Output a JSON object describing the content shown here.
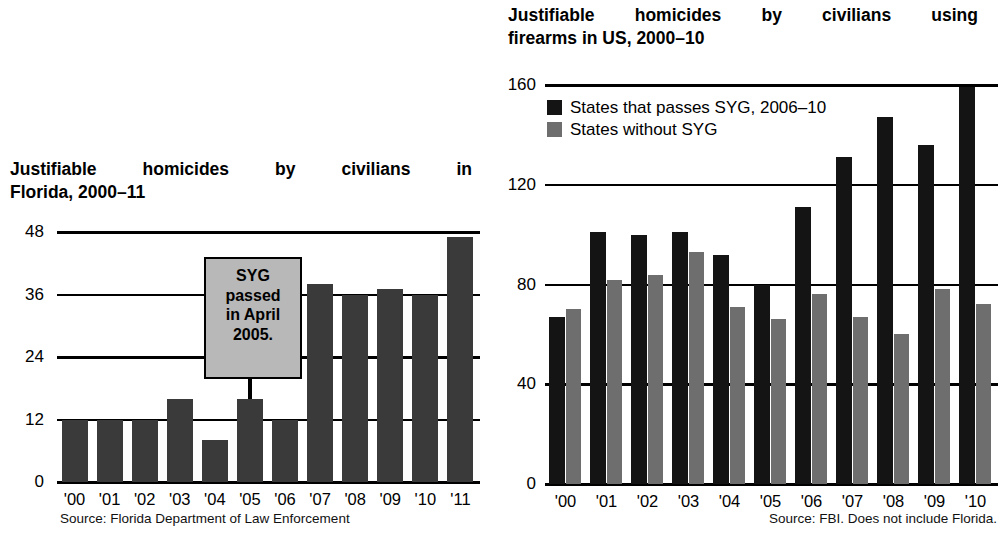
{
  "left": {
    "title_line1": "Justifiable homicides by civilians in",
    "title_line2": "Florida, 2000–11",
    "source": "Source: Florida Department of Law Enforcement",
    "callout_line1": "SYG",
    "callout_line2": "passed",
    "callout_line3": "in April",
    "callout_line4": "2005.",
    "yticks": [
      "48",
      "36",
      "24",
      "12",
      "0"
    ]
  },
  "right": {
    "title_line1": "Justifiable homicides by civilians using",
    "title_line2": "firearms in US, 2000–10",
    "source": "Source: FBI. Does not include Florida.",
    "yticks": [
      "160",
      "120",
      "80",
      "40",
      "0"
    ],
    "legend": [
      {
        "label": "States that passes SYG, 2006–10",
        "color": "#141414",
        "key": "black"
      },
      {
        "label": "States without SYG",
        "color": "#6e6e6e",
        "key": "gray"
      }
    ]
  },
  "colors": {
    "bar_dark": "#3a3a3a",
    "bar_black": "#141414",
    "bar_gray": "#6e6e6e",
    "callout_fill": "#b8b8b8",
    "axis": "#000000",
    "background": "#ffffff"
  },
  "chart_data": [
    {
      "type": "bar",
      "id": "florida",
      "title": "Justifiable homicides by civilians in Florida, 2000–11",
      "xlabel": "",
      "ylabel": "",
      "ylim": [
        0,
        48
      ],
      "yticks": [
        0,
        12,
        24,
        36,
        48
      ],
      "grid": true,
      "legend": "none",
      "source": "Source: Florida Department of Law Enforcement",
      "annotation": "SYG passed in April 2005.",
      "categories": [
        "'00",
        "'01",
        "'02",
        "'03",
        "'04",
        "'05",
        "'06",
        "'07",
        "'08",
        "'09",
        "'10",
        "'11"
      ],
      "values": [
        12,
        12,
        12,
        16,
        8,
        16,
        12,
        38,
        36,
        37,
        36,
        47
      ]
    },
    {
      "type": "bar",
      "id": "us-firearms",
      "title": "Justifiable homicides by civilians using firearms in US, 2000–10",
      "xlabel": "",
      "ylabel": "",
      "ylim": [
        0,
        160
      ],
      "yticks": [
        0,
        40,
        80,
        120,
        160
      ],
      "grid": true,
      "legend": "top-left",
      "source": "Source: FBI. Does not include Florida.",
      "categories": [
        "'00",
        "'01",
        "'02",
        "'03",
        "'04",
        "'05",
        "'06",
        "'07",
        "'08",
        "'09",
        "'10"
      ],
      "series": [
        {
          "name": "States that passes SYG, 2006–10",
          "color": "#141414",
          "values": [
            67,
            101,
            100,
            101,
            92,
            80,
            111,
            131,
            147,
            136,
            159
          ]
        },
        {
          "name": "States without SYG",
          "color": "#6e6e6e",
          "values": [
            70,
            82,
            84,
            93,
            71,
            66,
            76,
            67,
            60,
            78,
            72
          ]
        }
      ]
    }
  ]
}
